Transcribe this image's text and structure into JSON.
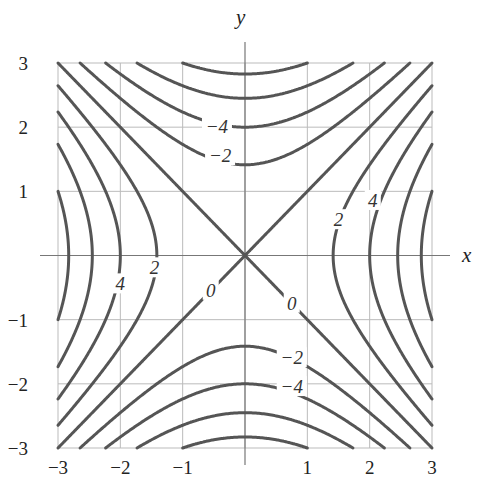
{
  "chart_data": {
    "type": "contour",
    "function": "x^2 - y^2",
    "title": "",
    "xlabel": "x",
    "ylabel": "y",
    "xlim": [
      -3,
      3
    ],
    "ylim": [
      -3,
      3
    ],
    "grid": true,
    "x_ticks": [
      -3,
      -2,
      -1,
      1,
      2,
      3
    ],
    "y_ticks": [
      -3,
      -2,
      -1,
      1,
      2,
      3
    ],
    "x_tick_labels": [
      "−3",
      "−2",
      "−1",
      "1",
      "2",
      "3"
    ],
    "y_tick_labels": [
      "−3",
      "−2",
      "−1",
      "1",
      "2",
      "3"
    ],
    "levels": [
      -8,
      -6,
      -4,
      -2,
      0,
      2,
      4,
      6,
      8
    ],
    "contour_labels": [
      {
        "text": "−4",
        "x": -0.45,
        "y": 2.0
      },
      {
        "text": "−2",
        "x": -0.4,
        "y": 1.55
      },
      {
        "text": "−2",
        "x": 0.75,
        "y": -1.6
      },
      {
        "text": "−4",
        "x": 0.75,
        "y": -2.05
      },
      {
        "text": "0",
        "x": -0.55,
        "y": -0.55
      },
      {
        "text": "0",
        "x": 0.75,
        "y": -0.75
      },
      {
        "text": "2",
        "x": -1.45,
        "y": -0.2
      },
      {
        "text": "4",
        "x": -2.0,
        "y": -0.45
      },
      {
        "text": "2",
        "x": 1.5,
        "y": 0.55
      },
      {
        "text": "4",
        "x": 2.05,
        "y": 0.85
      }
    ],
    "line_color": "#555555",
    "grid_color": "#bbbbbb"
  },
  "axes": {
    "x_label": "x",
    "y_label": "y"
  }
}
